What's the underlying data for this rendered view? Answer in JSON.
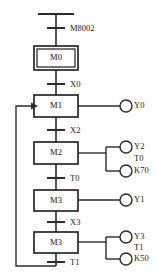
{
  "diagram": {
    "type": "sequential-function-chart",
    "colors": {
      "line": "#2b2b2b",
      "step_border": "#1a1a1a",
      "background": "#ffffff",
      "text": "#111111"
    },
    "initial_bar": {
      "present": true
    },
    "steps": [
      {
        "id": "M0",
        "label": "M0",
        "initial": true,
        "outputs": []
      },
      {
        "id": "M1",
        "label": "M1",
        "initial": false,
        "outputs": [
          {
            "label": "Y0"
          }
        ]
      },
      {
        "id": "M2",
        "label": "M2",
        "initial": false,
        "outputs": [
          {
            "label": "Y2"
          },
          {
            "label": "T0",
            "preset": "K70"
          }
        ]
      },
      {
        "id": "M3a",
        "label": "M3",
        "initial": false,
        "outputs": [
          {
            "label": "Y1"
          }
        ]
      },
      {
        "id": "M3b",
        "label": "M3",
        "initial": false,
        "outputs": [
          {
            "label": "Y3"
          },
          {
            "label": "T1",
            "preset": "K50"
          }
        ]
      }
    ],
    "transitions": [
      {
        "label": "M8002"
      },
      {
        "label": "X0"
      },
      {
        "label": "X2"
      },
      {
        "label": "T0"
      },
      {
        "label": "X3"
      },
      {
        "label": "T1"
      }
    ],
    "loopback": {
      "from_step": "M3b",
      "to_step": "M1",
      "arrow": true
    }
  }
}
